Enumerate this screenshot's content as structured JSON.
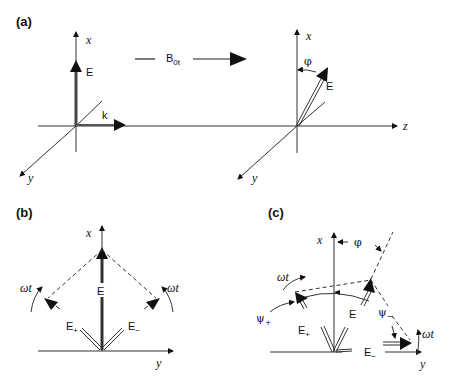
{
  "panels": {
    "a": {
      "label": "(a)",
      "left": {
        "x_axis": "x",
        "y_axis": "y",
        "vector": "E",
        "wave_vector": "k"
      },
      "middle": {
        "field_label": "B",
        "field_sub": "0t"
      },
      "right": {
        "x_axis": "x",
        "y_axis": "y",
        "z_axis": "z",
        "angle": "φ",
        "vector": "E"
      }
    },
    "b": {
      "label": "(b)",
      "x_axis": "x",
      "y_axis": "y",
      "vector": "E",
      "e_plus": "E",
      "e_plus_sub": "+",
      "e_minus": "E",
      "e_minus_sub": "−",
      "rot_left": "ωt",
      "rot_right": "ωt"
    },
    "c": {
      "label": "(c)",
      "x_axis": "x",
      "y_axis": "y",
      "angle": "φ",
      "vector": "E",
      "e_plus": "E",
      "e_plus_sub": "+",
      "e_minus": "E",
      "e_minus_sub": "−",
      "psi_plus": "ψ",
      "psi_plus_sub": "+",
      "psi_minus": "ψ",
      "psi_minus_sub": "−",
      "rot_left": "ωt",
      "rot_right": "ωt"
    }
  }
}
